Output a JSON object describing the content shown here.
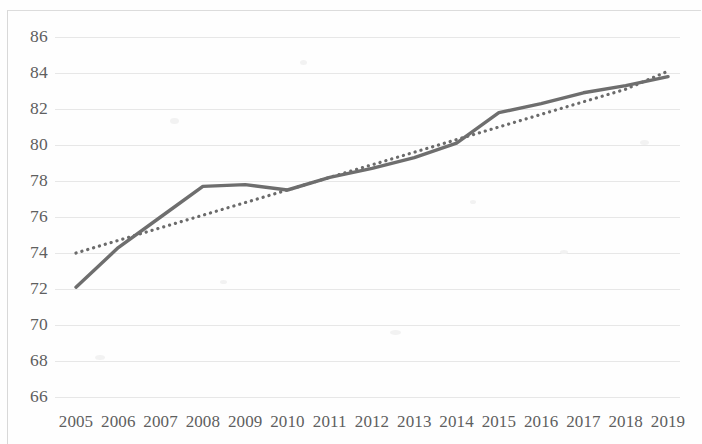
{
  "chart_data": {
    "type": "line",
    "title": "",
    "subtitle": "",
    "xlabel": "",
    "ylabel": "",
    "x": [
      2005,
      2006,
      2007,
      2008,
      2009,
      2010,
      2011,
      2012,
      2013,
      2014,
      2015,
      2016,
      2017,
      2018,
      2019
    ],
    "xtick_labels": [
      "2005",
      "2006",
      "2007",
      "2008",
      "2009",
      "2010",
      "2011",
      "2012",
      "2013",
      "2014",
      "2015",
      "2016",
      "2017",
      "2018",
      "2019"
    ],
    "ytick_labels": [
      "86",
      "84",
      "82",
      "80",
      "78",
      "76",
      "74",
      "72",
      "70",
      "68",
      "66"
    ],
    "yticks": [
      86,
      84,
      82,
      80,
      78,
      76,
      74,
      72,
      70,
      68,
      66
    ],
    "ylim": [
      66,
      86
    ],
    "xlim": [
      2005,
      2019
    ],
    "grid": "horizontal",
    "legend": "none",
    "series": [
      {
        "name": "data-line",
        "style": "solid",
        "color": "#6e6e6e",
        "width": 3.4,
        "values": [
          72.1,
          74.3,
          76.0,
          77.7,
          77.8,
          77.5,
          78.2,
          78.7,
          79.3,
          80.1,
          81.8,
          82.3,
          82.9,
          83.3,
          83.8
        ]
      },
      {
        "name": "trendline",
        "style": "dotted",
        "color": "#6b6b6b",
        "width": 3.2,
        "values": [
          74.0,
          74.7,
          75.4,
          76.1,
          76.8,
          77.5,
          78.2,
          78.9,
          79.6,
          80.3,
          81.0,
          81.7,
          82.4,
          83.1,
          84.1
        ]
      }
    ]
  },
  "axes": {
    "y_label_suffix": "",
    "x_label_suffix": ""
  }
}
